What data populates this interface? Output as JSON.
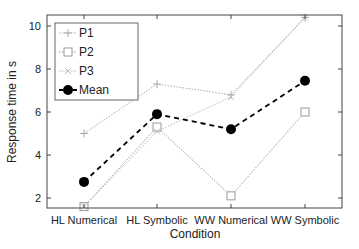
{
  "chart_data": {
    "type": "line",
    "title": "",
    "xlabel": "Condition",
    "ylabel": "Response time in s",
    "categories": [
      "HL Numerical",
      "HL Symbolic",
      "WW Numerical",
      "WW Symbolic"
    ],
    "ylim": [
      1.5,
      10.4
    ],
    "yticks": [
      2,
      4,
      6,
      8,
      10
    ],
    "grid": false,
    "legend_position": "upper-left",
    "series": [
      {
        "name": "P1",
        "marker": "plus",
        "line": "dotted",
        "color": "#aaaaaa",
        "values": [
          5.0,
          7.3,
          6.8,
          10.4
        ]
      },
      {
        "name": "P2",
        "marker": "square",
        "line": "dotted",
        "color": "#999999",
        "values": [
          1.6,
          5.3,
          2.1,
          6.0
        ]
      },
      {
        "name": "P3",
        "marker": "x",
        "line": "dotted",
        "color": "#bbbbbb",
        "values": [
          1.6,
          5.1,
          6.7,
          10.4
        ]
      },
      {
        "name": "Mean",
        "marker": "filled-circle",
        "line": "dashed",
        "color": "#000000",
        "values": [
          2.75,
          5.9,
          5.2,
          7.45
        ]
      }
    ]
  }
}
